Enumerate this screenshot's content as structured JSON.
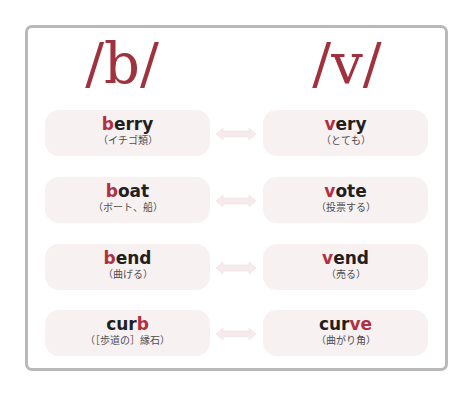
{
  "headings": {
    "left": {
      "slash_open": "/",
      "symbol": "b",
      "slash_close": "/"
    },
    "right": {
      "slash_open": "/",
      "symbol": "v",
      "slash_close": "/"
    }
  },
  "colors": {
    "accent": "#b0303f",
    "pill_bg": "#f8f1f2",
    "frame_border": "#b9b9b9",
    "arrow": "#f4e6e8"
  },
  "pairs": [
    {
      "left": {
        "pre": "",
        "hl": "b",
        "post": "erry",
        "gloss": "（イチゴ類）"
      },
      "right": {
        "pre": "",
        "hl": "v",
        "post": "ery",
        "gloss": "（とても）"
      },
      "arrow": "double-arrow-icon"
    },
    {
      "left": {
        "pre": "",
        "hl": "b",
        "post": "oat",
        "gloss": "（ボート、船）"
      },
      "right": {
        "pre": "",
        "hl": "v",
        "post": "ote",
        "gloss": "（投票する）"
      },
      "arrow": "double-arrow-icon"
    },
    {
      "left": {
        "pre": "",
        "hl": "b",
        "post": "end",
        "gloss": "（曲げる）"
      },
      "right": {
        "pre": "",
        "hl": "v",
        "post": "end",
        "gloss": "（売る）"
      },
      "arrow": "double-arrow-icon"
    },
    {
      "left": {
        "pre": "cur",
        "hl": "b",
        "post": "",
        "gloss": "（［歩道の］縁石）"
      },
      "right": {
        "pre": "cur",
        "hl": "ve",
        "post": "",
        "gloss": "（曲がり角）"
      },
      "arrow": "double-arrow-icon"
    }
  ]
}
